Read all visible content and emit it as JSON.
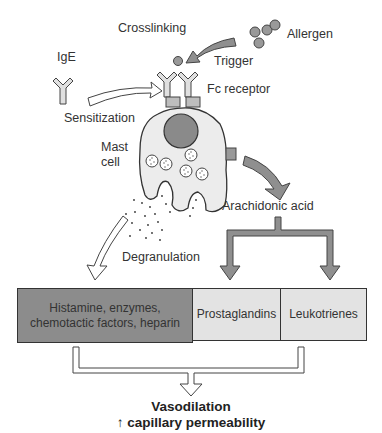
{
  "labels": {
    "crosslinking": "Crosslinking",
    "allergen": "Allergen",
    "ige": "IgE",
    "trigger": "Trigger",
    "fc_receptor": "Fc receptor",
    "sensitization": "Sensitization",
    "mast_cell_line1": "Mast",
    "mast_cell_line2": "cell",
    "arachidonic_acid": "Arachidonic acid",
    "degranulation": "Degranulation"
  },
  "boxes": {
    "mediators": "Histamine, enzymes, chemotactic factors, heparin",
    "prostaglandins": "Prostaglandins",
    "leukotrienes": "Leukotrienes"
  },
  "outcome": {
    "line1": "Vasodilation",
    "line2_arrow": "↑",
    "line2_text": "capillary permeability"
  },
  "colors": {
    "dark_box": "#8c8c8c",
    "light_box": "#e3e3e3",
    "arrow_gray": "#8f8f8f",
    "cell_fill": "#ececec",
    "nucleus": "#8a8a8a",
    "outline": "#333333"
  }
}
